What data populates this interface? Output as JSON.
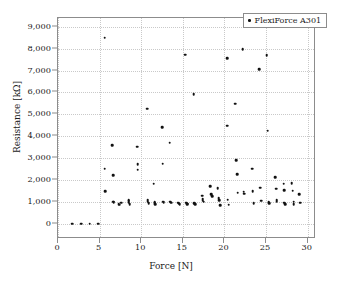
{
  "chart_data": {
    "type": "scatter",
    "title": "",
    "xlabel": "Force [N]",
    "ylabel": "Resistance [kΩ]",
    "xlim": [
      0,
      31
    ],
    "ylim": [
      -700,
      9400
    ],
    "xticks": [
      0,
      5,
      10,
      15,
      20,
      25,
      30
    ],
    "xtick_labels": [
      "0",
      "5",
      "10",
      "15",
      "20",
      "25",
      "30"
    ],
    "yticks": [
      0,
      1000,
      2000,
      3000,
      4000,
      5000,
      6000,
      7000,
      8000,
      9000
    ],
    "ytick_labels": [
      "0",
      "1,000",
      "2,000",
      "3,000",
      "4,000",
      "5,000",
      "6,000",
      "7,000",
      "8,000",
      "9,000"
    ],
    "grid": true,
    "legend_position": "top-right",
    "series": [
      {
        "name": "FlexiForce A301",
        "marker": "dot",
        "color": "#111111",
        "points": [
          [
            1.7,
            0
          ],
          [
            2.8,
            0
          ],
          [
            3.8,
            0
          ],
          [
            4.8,
            0
          ],
          [
            5.6,
            8500
          ],
          [
            5.6,
            2520
          ],
          [
            5.7,
            1490
          ],
          [
            6.5,
            3580
          ],
          [
            6.6,
            2220
          ],
          [
            6.6,
            1010
          ],
          [
            6.7,
            990
          ],
          [
            7.3,
            900
          ],
          [
            7.4,
            870
          ],
          [
            7.6,
            950
          ],
          [
            8.5,
            1080
          ],
          [
            8.5,
            1020
          ],
          [
            8.5,
            960
          ],
          [
            8.6,
            900
          ],
          [
            9.5,
            3520
          ],
          [
            9.6,
            2710
          ],
          [
            9.6,
            2470
          ],
          [
            10.7,
            5260
          ],
          [
            10.8,
            1080
          ],
          [
            10.8,
            1000
          ],
          [
            10.9,
            930
          ],
          [
            11.5,
            1830
          ],
          [
            11.6,
            990
          ],
          [
            11.6,
            940
          ],
          [
            11.7,
            900
          ],
          [
            12.5,
            4400
          ],
          [
            12.6,
            2740
          ],
          [
            12.6,
            1010
          ],
          [
            12.7,
            980
          ],
          [
            13.4,
            3710
          ],
          [
            13.5,
            1000
          ],
          [
            13.6,
            960
          ],
          [
            14.4,
            960
          ],
          [
            14.5,
            930
          ],
          [
            14.6,
            900
          ],
          [
            15.3,
            7720
          ],
          [
            15.4,
            960
          ],
          [
            15.5,
            920
          ],
          [
            15.5,
            880
          ],
          [
            16.3,
            5930
          ],
          [
            16.4,
            930
          ],
          [
            16.5,
            880
          ],
          [
            17.3,
            1280
          ],
          [
            17.4,
            1120
          ],
          [
            17.4,
            1050
          ],
          [
            17.5,
            1010
          ],
          [
            18.3,
            1700
          ],
          [
            18.4,
            1340
          ],
          [
            18.5,
            1260
          ],
          [
            19.2,
            1610
          ],
          [
            19.3,
            1160
          ],
          [
            19.4,
            1060
          ],
          [
            19.5,
            850
          ],
          [
            20.3,
            7570
          ],
          [
            20.3,
            4480
          ],
          [
            20.4,
            1100
          ],
          [
            20.5,
            860
          ],
          [
            21.3,
            5490
          ],
          [
            21.4,
            2910
          ],
          [
            21.5,
            2250
          ],
          [
            21.6,
            1420
          ],
          [
            22.2,
            7970
          ],
          [
            22.3,
            1470
          ],
          [
            22.4,
            1370
          ],
          [
            23.3,
            2510
          ],
          [
            23.4,
            1490
          ],
          [
            23.5,
            930
          ],
          [
            24.2,
            7060
          ],
          [
            24.3,
            1650
          ],
          [
            24.4,
            1050
          ],
          [
            25.1,
            7710
          ],
          [
            25.2,
            4250
          ],
          [
            25.3,
            970
          ],
          [
            25.4,
            930
          ],
          [
            26.1,
            2120
          ],
          [
            26.2,
            1600
          ],
          [
            26.3,
            1090
          ],
          [
            26.3,
            1020
          ],
          [
            27.1,
            1830
          ],
          [
            27.2,
            1520
          ],
          [
            27.2,
            960
          ],
          [
            27.3,
            900
          ],
          [
            28.1,
            1860
          ],
          [
            28.2,
            1500
          ],
          [
            28.3,
            1010
          ],
          [
            28.3,
            880
          ],
          [
            29.0,
            1340
          ],
          [
            29.1,
            960
          ]
        ]
      }
    ]
  },
  "legend": {
    "entries": [
      {
        "label": "FlexiForce A301"
      }
    ]
  }
}
